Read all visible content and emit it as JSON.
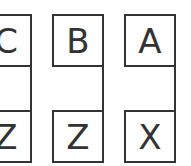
{
  "diagram": {
    "columns": [
      {
        "top": "C",
        "bottom": "Z"
      },
      {
        "top": "B",
        "bottom": "Z"
      },
      {
        "top": "A",
        "bottom": "X"
      }
    ]
  },
  "colors": {
    "stroke": "#333333",
    "background": "#ffffff"
  }
}
